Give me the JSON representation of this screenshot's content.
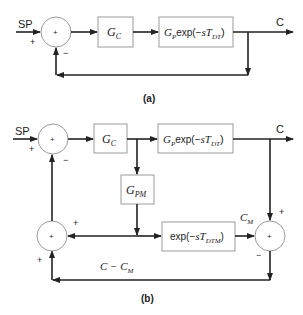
{
  "diagram_a": {
    "caption": "(a)",
    "input_label": "SP",
    "output_label": "C",
    "summer": {
      "center_sign": "+",
      "input_sign": "+",
      "feedback_sign": "−"
    },
    "blocks": {
      "controller": {
        "main": "G",
        "sub": "C"
      },
      "process": {
        "main": "G",
        "sub": "P",
        "text": "exp(−",
        "var": "sT",
        "sub2": "DT",
        "close": ")"
      }
    }
  },
  "diagram_b": {
    "caption": "(b)",
    "input_label": "SP",
    "output_label": "C",
    "summer_main": {
      "center_sign": "+",
      "input_sign": "+",
      "feedback_sign": "−"
    },
    "summer_feedback": {
      "center_sign": "+",
      "top_sign": "+",
      "right_sign": "+",
      "bottom_sign": "+"
    },
    "summer_model": {
      "center_sign": "+",
      "top_sign": "+",
      "bottom_sign": "−"
    },
    "blocks": {
      "controller": {
        "main": "G",
        "sub": "C"
      },
      "process": {
        "main": "G",
        "sub": "P",
        "text": "exp(−",
        "var": "sT",
        "sub2": "DT",
        "close": ")"
      },
      "model": {
        "main": "G",
        "sub": "PM"
      },
      "model_delay": {
        "text": "exp(−",
        "var": "sT",
        "sub2": "DTM",
        "close": ")"
      }
    },
    "signals": {
      "model_output": {
        "main": "C",
        "sub": "M"
      },
      "error": {
        "main": "C − C",
        "sub": "M"
      }
    }
  }
}
